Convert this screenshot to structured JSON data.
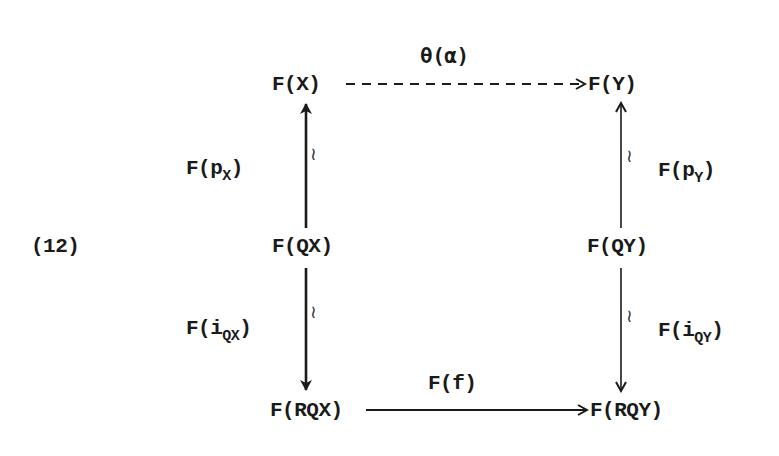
{
  "diagram": {
    "equation_number": "(12)",
    "nodes": {
      "FX": "F(X)",
      "FY": "F(Y)",
      "FQX": "F(QX)",
      "FQY": "F(QY)",
      "FRQX": "F(RQX)",
      "FRQY": "F(RQY)"
    },
    "arrows": {
      "top": {
        "label": "θ(α)",
        "from": "F(X)",
        "to": "F(Y)",
        "style": "dashed"
      },
      "left_upper": {
        "label_main": "F(p",
        "label_sub": "X",
        "label_close": ")",
        "from": "F(QX)",
        "to": "F(X)",
        "iso_mark": "≀"
      },
      "right_upper": {
        "label_main": "F(p",
        "label_sub": "Y",
        "label_close": ")",
        "from": "F(QY)",
        "to": "F(Y)",
        "iso_mark": "≀"
      },
      "left_lower": {
        "label_main": "F(i",
        "label_sub": "QX",
        "label_close": ")",
        "from": "F(QX)",
        "to": "F(RQX)",
        "iso_mark": "≀"
      },
      "right_lower": {
        "label_main": "F(i",
        "label_sub": "QY",
        "label_close": ")",
        "from": "F(QY)",
        "to": "F(RQY)",
        "iso_mark": "≀"
      },
      "bottom": {
        "label": "F(f)",
        "from": "F(RQX)",
        "to": "F(RQY)",
        "style": "solid"
      }
    },
    "colors": {
      "ink": "#1a1a1a",
      "background": "#ffffff"
    }
  }
}
